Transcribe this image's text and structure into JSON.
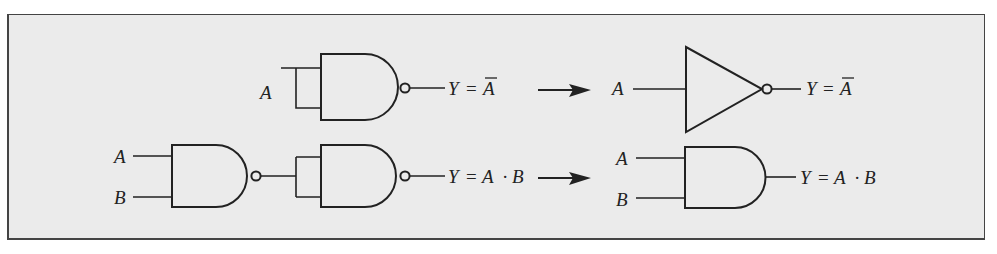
{
  "figure": {
    "rows": [
      {
        "name": "not-equivalence",
        "input_label": "A",
        "nand_output": {
          "lhs": "Y",
          "eq": "=",
          "rhs": "A",
          "rhs_overbar": true
        },
        "result_gate": "NOT",
        "result_input_label": "A",
        "result_output": {
          "lhs": "Y",
          "eq": "=",
          "rhs": "A",
          "rhs_overbar": true
        }
      },
      {
        "name": "and-equivalence",
        "input_labels": [
          "A",
          "B"
        ],
        "nand_output": {
          "lhs": "Y",
          "eq": "=",
          "a": "A",
          "dot": "·",
          "b": "B"
        },
        "result_gate": "AND",
        "result_input_labels": [
          "A",
          "B"
        ],
        "result_output": {
          "lhs": "Y",
          "eq": "=",
          "a": "A",
          "dot": "·",
          "b": "B"
        }
      }
    ],
    "colors": {
      "background": "#ebebeb",
      "stroke": "#222222",
      "border": "#444444"
    }
  }
}
